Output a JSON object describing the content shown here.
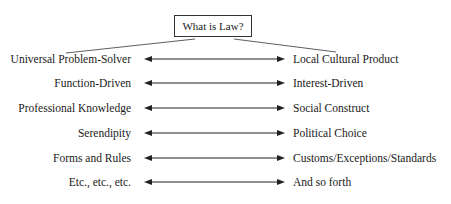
{
  "title": "What is Law?",
  "rows": [
    {
      "left": "Universal Problem-Solver",
      "right": "Local Cultural Product"
    },
    {
      "left": "Function-Driven",
      "right": "Interest-Driven"
    },
    {
      "left": "Professional Knowledge",
      "right": "Social Construct"
    },
    {
      "left": "Serendipity",
      "right": "Political Choice"
    },
    {
      "left": "Forms and Rules",
      "right": "Customs/Exceptions/Standards"
    },
    {
      "left": "Etc., etc., etc.",
      "right": "And so forth"
    }
  ],
  "colors": {
    "line": "#333333",
    "text": "#1a1a1a",
    "background": "#ffffff"
  }
}
